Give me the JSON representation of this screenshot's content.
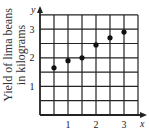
{
  "chart_data": {
    "type": "scatter",
    "title": "",
    "xlabel": "x",
    "ylabel": "Yield of lima beans in kilograms",
    "ylabel_lines": [
      "Yield of lima beans",
      "in kilograms"
    ],
    "y_axis_letter": "y",
    "x_axis_letter": "x",
    "xlim": [
      0,
      3.5
    ],
    "ylim": [
      0,
      3.5
    ],
    "x_ticks": [
      1,
      2,
      3
    ],
    "y_ticks": [
      1,
      2,
      3
    ],
    "x_tick_labels": [
      "1",
      "2",
      "3"
    ],
    "y_tick_labels": [
      "1",
      "2",
      "3"
    ],
    "grid": true,
    "grid_step": 0.5,
    "legend": null,
    "series": [
      {
        "name": "yield",
        "x": [
          0.5,
          1.0,
          1.5,
          2.0,
          2.5,
          3.0
        ],
        "y": [
          1.65,
          1.9,
          2.0,
          2.45,
          2.7,
          2.9
        ]
      }
    ],
    "colors": {
      "grid": "#222222",
      "points": "#111111",
      "text": "#1a1a1a"
    }
  }
}
